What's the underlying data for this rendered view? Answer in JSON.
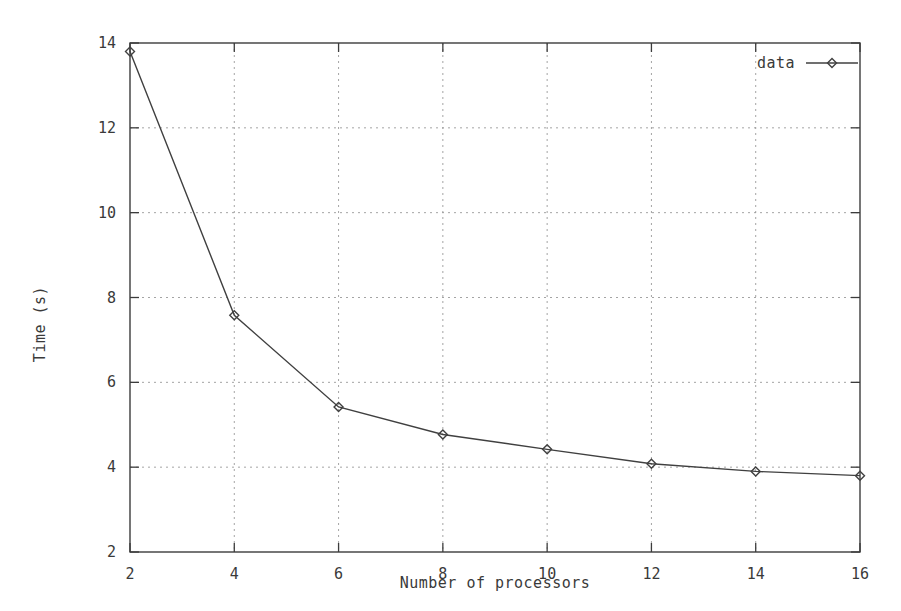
{
  "chart_data": {
    "type": "line",
    "title": "",
    "subtitle": "",
    "xlabel": "Number of processors",
    "ylabel": "Time (s)",
    "xlim": [
      2,
      16
    ],
    "ylim": [
      2,
      14
    ],
    "xticks": [
      2,
      4,
      6,
      8,
      10,
      12,
      14,
      16
    ],
    "yticks": [
      2,
      4,
      6,
      8,
      10,
      12,
      14
    ],
    "xtick_labels": [
      "2",
      "4",
      "6",
      "8",
      "10",
      "12",
      "14",
      "16"
    ],
    "ytick_labels": [
      "2",
      "4",
      "6",
      "8",
      "10",
      "12",
      "14"
    ],
    "grid": true,
    "grid_style": "dotted",
    "legend_position": "top-right",
    "marker": "diamond",
    "line_color": "#404040",
    "grid_color": "#9a9a9a",
    "frame_color": "#3c3c3c",
    "background": "#ffffff",
    "x": [
      2,
      4,
      6,
      8,
      10,
      12,
      14,
      16
    ],
    "series": [
      {
        "name": "data",
        "values": [
          13.8,
          7.58,
          5.42,
          4.77,
          4.42,
          4.08,
          3.9,
          3.8
        ]
      }
    ]
  },
  "legend": {
    "entries": [
      {
        "label": "data"
      }
    ]
  },
  "axes": {
    "x_title": "Number of processors",
    "y_title": "Time (s)"
  }
}
